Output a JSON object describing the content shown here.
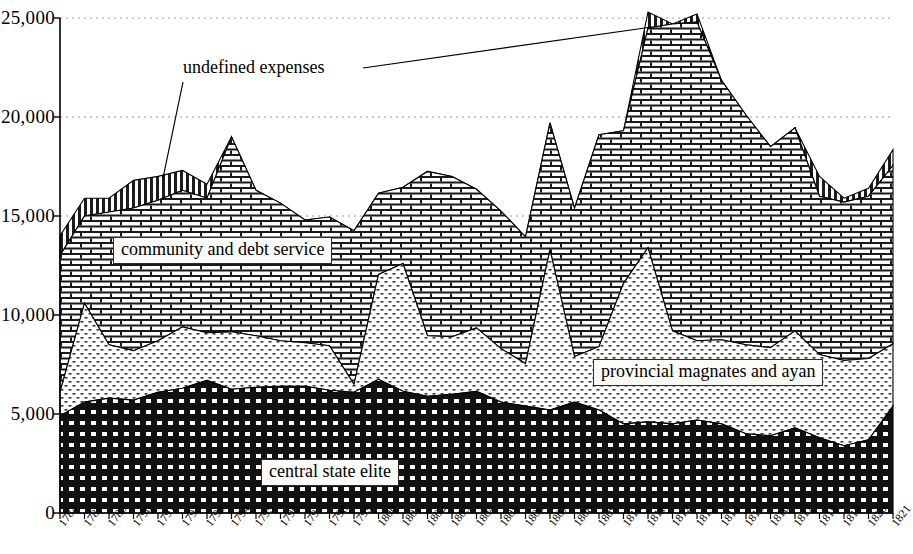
{
  "chart_data": {
    "type": "area",
    "stacked": true,
    "title": "",
    "subtitle": "",
    "xlabel": "",
    "ylabel": "",
    "grid": "horizontal dotted at 5,000 intervals",
    "legend_position": "inline labels on bands",
    "ylim": [
      0,
      25000
    ],
    "yticks": [
      0,
      5000,
      10000,
      15000,
      20000,
      25000
    ],
    "ytick_labels": [
      "0",
      "5,000",
      "10,000",
      "15,000",
      "20,000",
      "25,000"
    ],
    "categories": [
      "1784",
      "1787",
      "1788",
      "1790",
      "1791",
      "1792",
      "1793",
      "1794",
      "1795",
      "1796",
      "1797",
      "1798",
      "1799",
      "1800",
      "1801",
      "1802",
      "1803",
      "1804",
      "1805",
      "1806",
      "1807",
      "1808",
      "1809",
      "1810",
      "1811",
      "1812",
      "1813",
      "1814",
      "1815",
      "1816",
      "1817",
      "1818",
      "1819",
      "1820",
      "1821"
    ],
    "series": [
      {
        "name": "central state elite",
        "pattern": "black-checker",
        "values": [
          4900,
          5600,
          5800,
          5700,
          6100,
          6300,
          6700,
          6250,
          6350,
          6400,
          6400,
          6200,
          6100,
          6750,
          6150,
          5900,
          6000,
          6150,
          5600,
          5400,
          5200,
          5600,
          5200,
          4500,
          4600,
          4500,
          4700,
          4500,
          4000,
          3900,
          4300,
          3800,
          3400,
          3700,
          5400
        ]
      },
      {
        "name": "provincial magnates and ayan",
        "pattern": "light-dotted",
        "values": [
          1200,
          5000,
          2700,
          2500,
          2600,
          3100,
          2400,
          2900,
          2600,
          2300,
          2200,
          2250,
          400,
          5300,
          6450,
          3050,
          2900,
          3200,
          2700,
          2150,
          8100,
          2300,
          3200,
          7100,
          8800,
          4700,
          4000,
          4250,
          4500,
          4450,
          4900,
          4200,
          4300,
          4100,
          3150
        ]
      },
      {
        "name": "community and debt service",
        "pattern": "brick",
        "values": [
          6900,
          4400,
          6700,
          7200,
          7100,
          6900,
          6800,
          9850,
          7350,
          6950,
          6200,
          6500,
          7750,
          4100,
          3850,
          8300,
          8100,
          7000,
          6950,
          6400,
          6400,
          7500,
          10700,
          7700,
          11100,
          15500,
          16100,
          13100,
          11600,
          10150,
          10250,
          8000,
          8000,
          8200,
          9000
        ]
      },
      {
        "name": "undefined expenses",
        "pattern": "vertical-stripe",
        "values": [
          1000,
          900,
          700,
          1400,
          1200,
          1000,
          700,
          0,
          0,
          0,
          0,
          0,
          0,
          0,
          0,
          0,
          0,
          0,
          0,
          0,
          0,
          0,
          0,
          0,
          800,
          0,
          400,
          0,
          0,
          0,
          0,
          1000,
          200,
          400,
          800
        ]
      }
    ],
    "series_totals": [
      14000,
      15900,
      15900,
      16800,
      17000,
      17300,
      16600,
      19000,
      16300,
      15650,
      14800,
      14950,
      14250,
      16150,
      16450,
      17250,
      17000,
      16350,
      15250,
      13950,
      19700,
      15400,
      19100,
      19300,
      25300,
      24700,
      25200,
      21850,
      20100,
      18500,
      19450,
      17000,
      15900,
      16400,
      18350
    ]
  },
  "axis": {
    "y_labels": [
      "25,000",
      "20,000",
      "15,000",
      "10,000",
      "5,000",
      "0"
    ],
    "x_labels": [
      "1784",
      "1787",
      "1788",
      "1790",
      "1791",
      "1792",
      "1793",
      "1794",
      "1795",
      "1796",
      "1797",
      "1798",
      "1799",
      "1800",
      "1801",
      "1802",
      "1803",
      "1804",
      "1805",
      "1806",
      "1807",
      "1808",
      "1809",
      "1810",
      "1811",
      "1812",
      "1813",
      "1814",
      "1815",
      "1816",
      "1817",
      "1818",
      "1819",
      "1820",
      "1821"
    ]
  },
  "annotations": {
    "undefined_expenses": "undefined expenses"
  },
  "band_labels": {
    "community": "community and debt service",
    "provincial": "provincial magnates and ayan",
    "central": "central state elite"
  },
  "colors": {
    "ink": "#000000",
    "background": "#ffffff",
    "label_box_fill": "#fbfbf8",
    "gridline": "#9a9a9a"
  }
}
